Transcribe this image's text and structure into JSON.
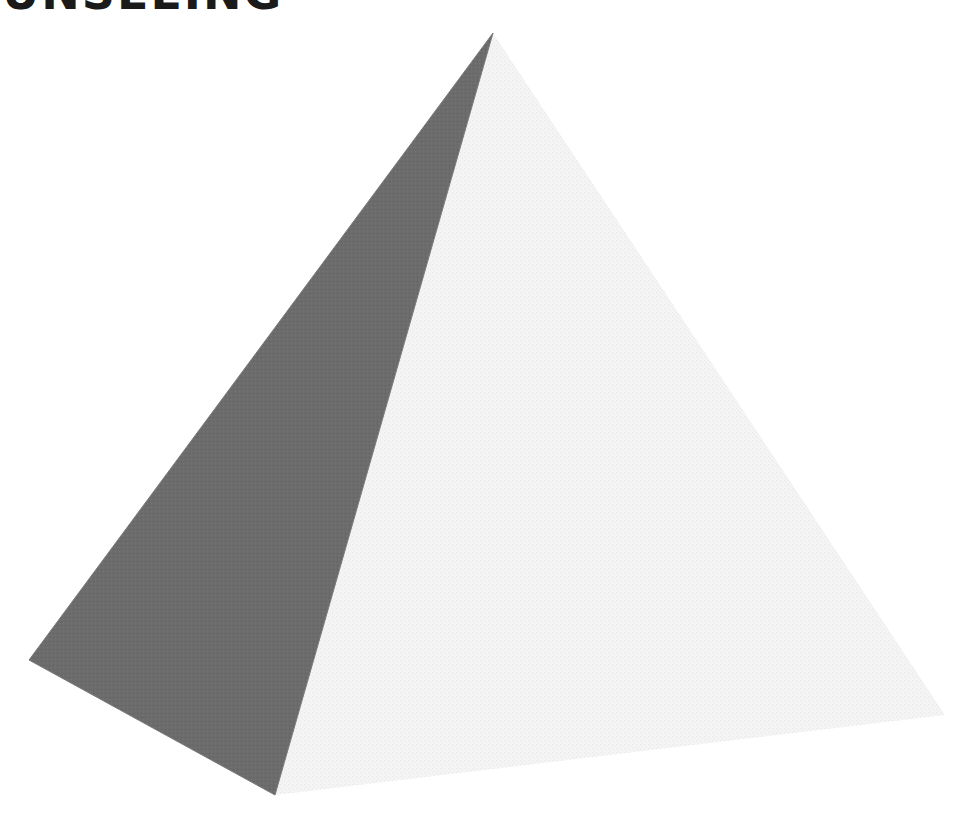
{
  "heading": {
    "text": "UNSEEING"
  },
  "figure": {
    "vertices": {
      "apex": [
        493,
        33
      ],
      "left": [
        29,
        660
      ],
      "bottom": [
        275,
        795
      ],
      "right": [
        945,
        715
      ]
    },
    "faces": [
      {
        "name": "shadow-face",
        "color": "#6b6b6b",
        "points": "493,33 29,660 275,795"
      },
      {
        "name": "lit-face",
        "color": "#f2f2f2",
        "points": "493,33 275,795 945,715"
      }
    ],
    "edge_color": "#8a8a8a"
  }
}
